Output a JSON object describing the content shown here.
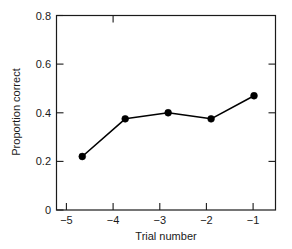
{
  "chart_data": {
    "type": "line",
    "title": "",
    "xlabel": "Trial number",
    "ylabel": "Proportion correct",
    "categories": [
      "−5",
      "−4",
      "−3",
      "−2",
      "−1"
    ],
    "x": [
      -5,
      -4,
      -3,
      -2,
      -1
    ],
    "values": [
      0.22,
      0.375,
      0.4,
      0.375,
      0.47
    ],
    "series": [
      {
        "name": "Proportion correct",
        "values": [
          0.22,
          0.375,
          0.4,
          0.375,
          0.47
        ],
        "color": "#000000",
        "marker": "filled-circle"
      }
    ],
    "xlim": [
      -5.6,
      -0.5
    ],
    "ylim": [
      0,
      0.8
    ],
    "yticks": [
      0,
      0.2,
      0.4,
      0.6,
      0.8
    ],
    "ytick_labels": [
      "0",
      "0.2",
      "0.4",
      "0.6",
      "0.8"
    ],
    "xticks": [
      -5,
      -4,
      -3,
      -2,
      -1
    ],
    "xtick_labels": [
      "−5",
      "−4",
      "−3",
      "−2",
      "−1"
    ],
    "grid": false,
    "legend": null,
    "frame": "box",
    "annotations": []
  },
  "axes": {
    "y_title": "Proportion correct",
    "x_title": "Trial number",
    "y_tick_0": "0",
    "y_tick_1": "0.2",
    "y_tick_2": "0.4",
    "y_tick_3": "0.6",
    "y_tick_4": "0.8",
    "x_tick_0": "−5",
    "x_tick_1": "−4",
    "x_tick_2": "−3",
    "x_tick_3": "−2",
    "x_tick_4": "−1"
  },
  "colors": {
    "line": "#000000",
    "marker": "#000000",
    "axis": "#1a1a1a",
    "background": "#ffffff"
  }
}
